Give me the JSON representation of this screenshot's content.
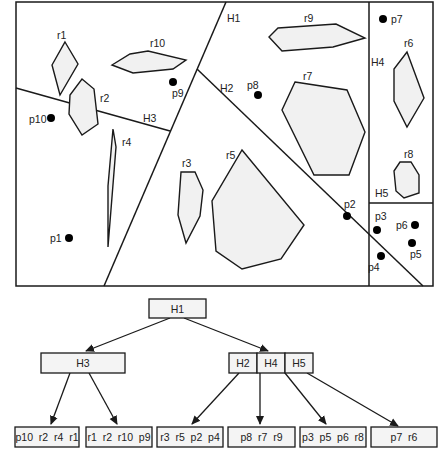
{
  "diagram": {
    "type": "spatial-partition-tree",
    "top_panel": {
      "partitions": [
        {
          "id": "H1",
          "label": "H1"
        },
        {
          "id": "H2",
          "label": "H2"
        },
        {
          "id": "H3",
          "label": "H3"
        },
        {
          "id": "H4",
          "label": "H4"
        },
        {
          "id": "H5",
          "label": "H5"
        }
      ],
      "regions": [
        {
          "id": "r1",
          "label": "r1"
        },
        {
          "id": "r2",
          "label": "r2"
        },
        {
          "id": "r3",
          "label": "r3"
        },
        {
          "id": "r4",
          "label": "r4"
        },
        {
          "id": "r5",
          "label": "r5"
        },
        {
          "id": "r6",
          "label": "r6"
        },
        {
          "id": "r7",
          "label": "r7"
        },
        {
          "id": "r8",
          "label": "r8"
        },
        {
          "id": "r9",
          "label": "r9"
        },
        {
          "id": "r10",
          "label": "r10"
        }
      ],
      "points": [
        {
          "id": "p1",
          "label": "p1"
        },
        {
          "id": "p2",
          "label": "p2"
        },
        {
          "id": "p3",
          "label": "p3"
        },
        {
          "id": "p4",
          "label": "p4"
        },
        {
          "id": "p5",
          "label": "p5"
        },
        {
          "id": "p6",
          "label": "p6"
        },
        {
          "id": "p7",
          "label": "p7"
        },
        {
          "id": "p8",
          "label": "p8"
        },
        {
          "id": "p9",
          "label": "p9"
        },
        {
          "id": "p10",
          "label": "p10"
        }
      ]
    },
    "tree": {
      "root": {
        "label": "H1"
      },
      "level1": {
        "left": {
          "label": "H3"
        },
        "right": {
          "cells": [
            "H2",
            "H4",
            "H5"
          ]
        }
      },
      "leaves": [
        {
          "label": "p10  r2  r4  r1"
        },
        {
          "label": "r1  r2  r10  p9"
        },
        {
          "label": "r3  r5  p2  p4"
        },
        {
          "label": "p8  r7  r9"
        },
        {
          "label": "p3  p5  p6  r8"
        },
        {
          "label": "p7  r6"
        }
      ]
    }
  }
}
